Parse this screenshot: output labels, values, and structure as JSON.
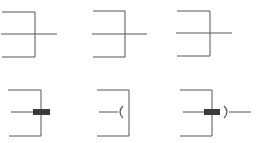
{
  "diagram": {
    "title": "",
    "line_color": "#555555",
    "fill_color": "#3a3a3a",
    "symbols": [
      {
        "id": "symbol-1",
        "type": "plain-cross",
        "row": 1,
        "col": 1
      },
      {
        "id": "symbol-2",
        "type": "plain-cross",
        "row": 1,
        "col": 2
      },
      {
        "id": "symbol-3",
        "type": "plain-cross",
        "row": 1,
        "col": 3
      },
      {
        "id": "symbol-4",
        "type": "component-plug",
        "row": 2,
        "col": 1
      },
      {
        "id": "symbol-5",
        "type": "socket",
        "row": 2,
        "col": 2
      },
      {
        "id": "symbol-6",
        "type": "plug-and-socket",
        "row": 2,
        "col": 3
      }
    ]
  }
}
